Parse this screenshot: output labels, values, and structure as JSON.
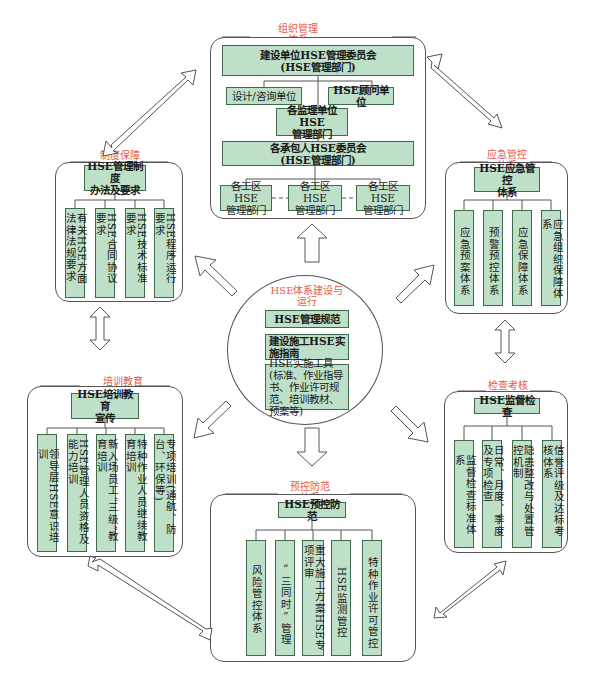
{
  "colors": {
    "box_fill": "#bfe0c8",
    "box_border": "#3f6b4c",
    "title_red": "#e8574a",
    "frame_border": "#555555"
  },
  "center": {
    "title": "HSE体系建设与运行",
    "title_line1": "HSE体系建设与",
    "title_line2": "运行",
    "items": [
      "HSE管理规范",
      "建设施工HSE实施指南",
      "HSE实施工具(标准、作业指导书、作业许可规范、培训教材、预案等)"
    ]
  },
  "organization": {
    "title_line1": "组织管理",
    "title_line2": "体系",
    "top": "建设单位HSE管理委员会(HSE管理部门)",
    "top_line1": "建设单位HSE管理委员会",
    "top_line2": "(HSE管理部门)",
    "left": "设计/咨询单位",
    "right": "HSE顾问单位",
    "supervisor_line1": "各监理单位HSE",
    "supervisor_line2": "管理部门",
    "contractor_line1": "各承包人HSE委员会",
    "contractor_line2": "(HSE管理部门)",
    "work_areas": [
      {
        "line1": "各工区HSE",
        "line2": "管理部门"
      },
      {
        "line1": "各工区HSE",
        "line2": "管理部门"
      },
      {
        "line1": "各工区HSE",
        "line2": "管理部门"
      }
    ]
  },
  "institution": {
    "title_line1": "制度保障",
    "title_line2": "体系",
    "head_line1": "HSE管理制度",
    "head_line2": "办法及要求",
    "items": [
      "有关HSE方面法律法规要求",
      "HSE合同协议要求",
      "HSE技术标准要求",
      "HSE程序运行要求"
    ]
  },
  "emergency": {
    "title_line1": "应急管控",
    "title_line2": "体系",
    "head_line1": "HSE应急管控",
    "head_line2": "体系",
    "items": [
      "应急预案体系",
      "预警预控体系",
      "应急保障体系",
      "应急组织保障体系"
    ]
  },
  "training": {
    "title_line1": "培训教育",
    "title_line2": "体系",
    "head_line1": "HSE培训教育",
    "head_line2": "宣传",
    "items": [
      "领导层HSE意识培训",
      "HSE管理人员资格及能力培训",
      "新入场员工“三级”教育培训",
      "特种作业人员继续教育培训",
      "专项培训(通航、防台、环保等)"
    ]
  },
  "inspection": {
    "title_line1": "检查考核",
    "title_line2": "体系",
    "head": "HSE监督检查",
    "items": [
      "监督检查标准体系",
      "日常、月度、季度及专项检查",
      "隐患整改与处置管控机制",
      "信誉评级及达标考核体系"
    ]
  },
  "prevention": {
    "title_line1": "预控防范",
    "title_line2": "体系",
    "head": "HSE预控防范",
    "items": [
      "风险管控体系",
      "“三同时”管理",
      "重大施工方案HSE专项评审",
      "HSE监测管控",
      "特种作业许可管控"
    ]
  }
}
